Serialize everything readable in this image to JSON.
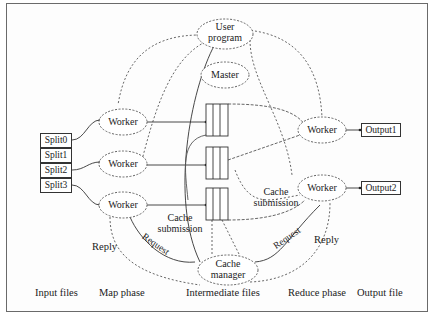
{
  "diagram": {
    "nodes": {
      "user_program": "User program",
      "user_line1": "User",
      "user_line2": "program",
      "master": "Master",
      "workers_map": [
        "Worker",
        "Worker",
        "Worker"
      ],
      "workers_reduce": [
        "Worker",
        "Worker"
      ],
      "cache_manager_line1": "Cache",
      "cache_manager_line2": "manager",
      "splits": [
        "Split0",
        "Split1",
        "Split2",
        "Split3"
      ],
      "outputs": [
        "Output1",
        "Output2"
      ]
    },
    "edge_labels": {
      "cache_submission_left_1": "Cache",
      "cache_submission_left_2": "submission",
      "cache_submission_right_1": "Cache",
      "cache_submission_right_2": "submission",
      "request_left": "Request",
      "reply_left": "Reply",
      "request_right": "Request",
      "reply_right": "Reply"
    },
    "phase_labels": [
      "Input files",
      "Map phase",
      "Intermediate files",
      "Reduce phase",
      "Output file"
    ]
  }
}
